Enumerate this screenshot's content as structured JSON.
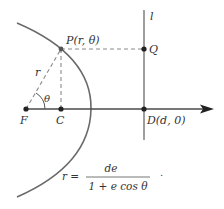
{
  "labels": {
    "P": "P(r, θ)",
    "Q": "Q",
    "l": "l",
    "r": "r",
    "theta": "θ",
    "F": "F",
    "C": "C",
    "D": "D(d, 0)"
  },
  "equation": {
    "lhs": "r =",
    "numerator": "de",
    "denominator": "1 + e cos θ",
    "trailing": "."
  },
  "colors": {
    "curve": "#6a6a6a",
    "axis": "#4a4a4a",
    "dashed": "#8a8a8a",
    "point": "#222222"
  }
}
